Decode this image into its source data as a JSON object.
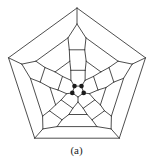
{
  "figure": {
    "type": "schlegel-diagram",
    "caption": "(a)",
    "line_color": "#3a3a3a",
    "dot_color": "#1a1a1a",
    "background": "#ffffff",
    "outer_face": "pentagon",
    "central_face": "pentagon",
    "highlighted_atoms": 4
  }
}
